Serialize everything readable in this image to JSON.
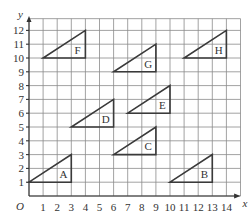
{
  "diagram": {
    "type": "coordinate-grid",
    "origin_label": "O",
    "x_axis_label": "x",
    "y_axis_label": "y",
    "x_ticks": [
      "1",
      "2",
      "3",
      "4",
      "5",
      "6",
      "7",
      "8",
      "9",
      "10",
      "11",
      "12",
      "13",
      "14"
    ],
    "y_ticks": [
      "1",
      "2",
      "3",
      "4",
      "5",
      "6",
      "7",
      "8",
      "9",
      "10",
      "11",
      "12"
    ],
    "x_range": [
      0,
      15
    ],
    "y_range": [
      0,
      13
    ],
    "triangles": [
      {
        "label": "A",
        "vertices": [
          [
            0,
            1
          ],
          [
            3,
            1
          ],
          [
            3,
            3
          ]
        ]
      },
      {
        "label": "B",
        "vertices": [
          [
            10,
            1
          ],
          [
            13,
            1
          ],
          [
            13,
            3
          ]
        ]
      },
      {
        "label": "C",
        "vertices": [
          [
            6,
            3
          ],
          [
            9,
            3
          ],
          [
            9,
            5
          ]
        ]
      },
      {
        "label": "D",
        "vertices": [
          [
            3,
            5
          ],
          [
            6,
            5
          ],
          [
            6,
            7
          ]
        ]
      },
      {
        "label": "E",
        "vertices": [
          [
            7,
            6
          ],
          [
            10,
            6
          ],
          [
            10,
            8
          ]
        ]
      },
      {
        "label": "F",
        "vertices": [
          [
            1,
            10
          ],
          [
            4,
            10
          ],
          [
            4,
            12
          ]
        ]
      },
      {
        "label": "G",
        "vertices": [
          [
            6,
            9
          ],
          [
            9,
            9
          ],
          [
            9,
            11
          ]
        ]
      },
      {
        "label": "H",
        "vertices": [
          [
            11,
            10
          ],
          [
            14,
            10
          ],
          [
            14,
            12
          ]
        ]
      }
    ]
  }
}
